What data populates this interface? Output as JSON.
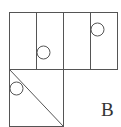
{
  "diagram": {
    "label": "B",
    "stroke_color": "#555555",
    "top_row": {
      "cells": 4,
      "circles_in_cells": [
        2,
        4
      ]
    },
    "bottom_square": {
      "diagonal": "top-left to bottom-right",
      "circle": "upper-left, tangent to left edge"
    }
  }
}
